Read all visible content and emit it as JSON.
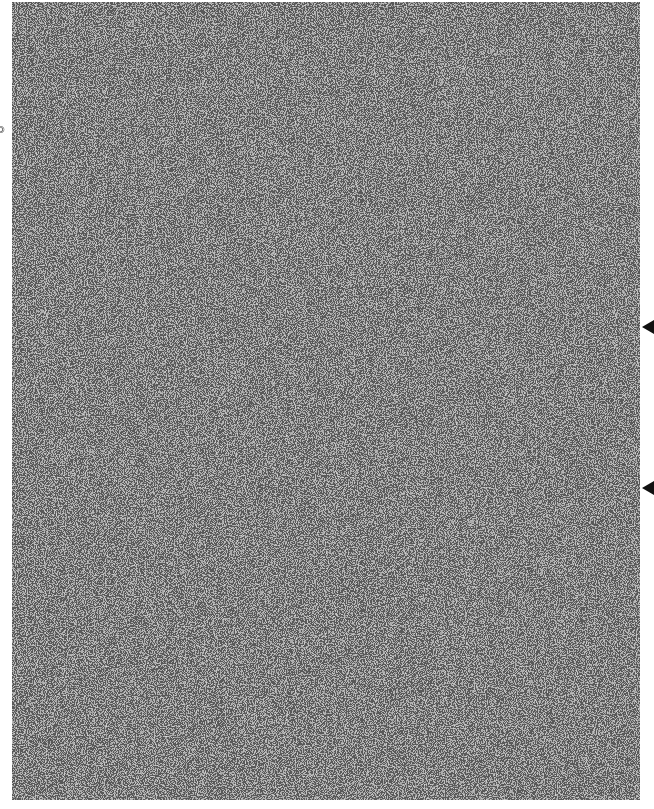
{
  "side_label": {
    "text": "©"
  },
  "noise_field": {
    "description": "dithered black-and-white noise image",
    "fg": "#1a1a1a",
    "bg": "#ffffff"
  },
  "markers": [
    {
      "name": "right-arrow-marker-1",
      "y": 327,
      "icon": "triangle-left-icon"
    },
    {
      "name": "right-arrow-marker-2",
      "y": 488,
      "icon": "triangle-left-icon"
    }
  ]
}
